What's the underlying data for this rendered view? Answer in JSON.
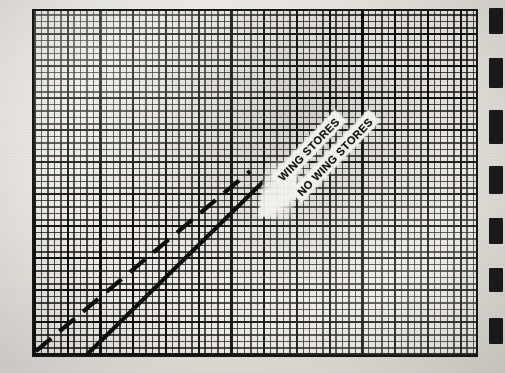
{
  "figure": {
    "kind": "scanned-graph-paper-plot",
    "background_color": "#e9e7e2",
    "ink_color": "#171717",
    "plot_fill": "#efece6",
    "frame": {
      "x": 32,
      "y": 9,
      "width": 446,
      "height": 348,
      "border_px": 2.5
    }
  },
  "labels": {
    "wing_stores": "WING STORES",
    "no_wing_stores": "NO WING STORES",
    "rotation_deg": -46
  },
  "edge_fragments": {
    "description": "cropped dark marks at the extreme right edge of the scan",
    "count": 7,
    "marks": [
      {
        "top": 8,
        "height": 26
      },
      {
        "top": 58,
        "height": 30
      },
      {
        "top": 110,
        "height": 34
      },
      {
        "top": 166,
        "height": 28
      },
      {
        "top": 218,
        "height": 26
      },
      {
        "top": 268,
        "height": 24
      },
      {
        "top": 318,
        "height": 26
      }
    ]
  },
  "chart_data": {
    "type": "line",
    "title": "",
    "subtitle": "",
    "xlabel": "",
    "ylabel": "",
    "xlim": [
      0,
      100
    ],
    "ylim": [
      0,
      100
    ],
    "grid": true,
    "grid_minor_spacing_px": 6.5,
    "grid_major_every": 5,
    "legend": "inline-rotated-labels",
    "annotations": [
      {
        "text": "WING STORES",
        "x": 48,
        "y": 58,
        "rotation": -46,
        "style": "white-banner"
      },
      {
        "text": "NO WING STORES",
        "x": 53,
        "y": 53,
        "rotation": -46,
        "style": "white-banner"
      }
    ],
    "series": [
      {
        "name": "WING STORES",
        "style": "dashed",
        "color": "#101010",
        "x": [
          0,
          10,
          20,
          30,
          40,
          48
        ],
        "y": [
          2,
          14,
          26,
          38,
          50,
          58
        ]
      },
      {
        "name": "NO WING STORES",
        "style": "solid",
        "color": "#101010",
        "x": [
          12,
          22,
          32,
          42,
          50,
          58
        ],
        "y": [
          0,
          12,
          24,
          36,
          46,
          56
        ]
      }
    ]
  }
}
